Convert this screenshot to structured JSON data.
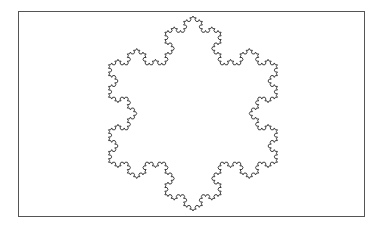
{
  "figure": {
    "frame": {
      "x": 18,
      "y": 11,
      "width": 347,
      "height": 206,
      "stroke": "#555555"
    },
    "snowflake": {
      "center_x": 193,
      "center_y": 113.5,
      "radius": 97.5,
      "iterations": 4,
      "stroke": "#2a2a2a",
      "stroke_width": 0.9,
      "fill": "none"
    }
  }
}
